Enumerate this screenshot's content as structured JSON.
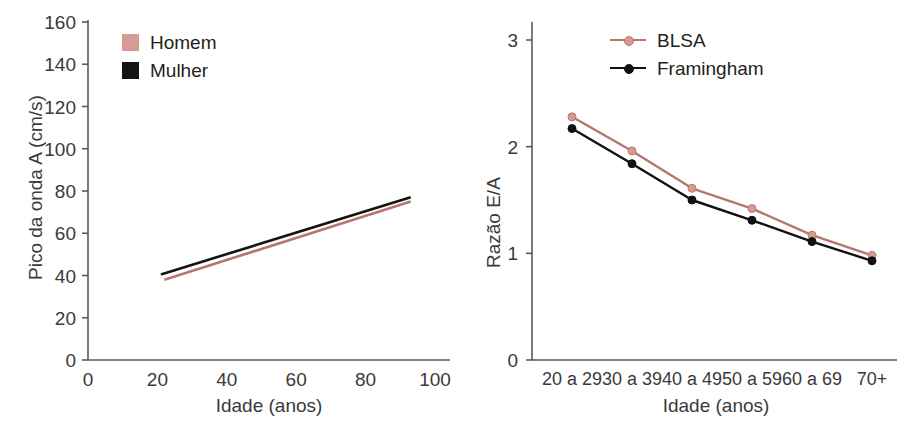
{
  "figure": {
    "background": "#ffffff",
    "panels": [
      "left",
      "right"
    ]
  },
  "colors": {
    "series_pink": "#b5766f",
    "series_pink_marker": "#d99a92",
    "series_black": "#111111",
    "axis": "#595959",
    "text": "#3a3a3a"
  },
  "left_panel": {
    "legend": [
      {
        "label": "Homem",
        "color": "#d59b94",
        "marker": "square"
      },
      {
        "label": "Mulher",
        "color": "#141414",
        "marker": "square"
      }
    ],
    "y_axis": {
      "title": "Pico da onda A (cm/s)",
      "ticks": [
        "0",
        "20",
        "40",
        "60",
        "80",
        "100",
        "120",
        "140",
        "160"
      ]
    },
    "x_axis": {
      "title": "Idade (anos)",
      "ticks": [
        "0",
        "20",
        "40",
        "60",
        "80",
        "100"
      ]
    }
  },
  "right_panel": {
    "legend": [
      {
        "label": "BLSA",
        "color": "#b5766f",
        "marker": "line-dot"
      },
      {
        "label": "Framingham",
        "color": "#111111",
        "marker": "line-dot"
      }
    ],
    "y_axis": {
      "title": "Razão E/A",
      "ticks": [
        "0",
        "1",
        "2",
        "3"
      ]
    },
    "x_axis": {
      "title": "Idade (anos)",
      "ticks": [
        "20 a 29",
        "30 a 39",
        "40 a 49",
        "50 a 59",
        "60 a 69",
        "70+"
      ]
    }
  },
  "chart_data": [
    {
      "type": "line",
      "id": "left-peak-a-wave-vs-age",
      "title": "",
      "xlabel": "Idade (anos)",
      "ylabel": "Pico da onda A (cm/s)",
      "xlim": [
        0,
        100
      ],
      "ylim": [
        0,
        160
      ],
      "xticks": [
        0,
        20,
        40,
        60,
        80,
        100
      ],
      "yticks": [
        0,
        20,
        40,
        60,
        80,
        100,
        120,
        140,
        160
      ],
      "grid": false,
      "legend_position": "top-left-inside",
      "note": "Two straight regression lines spanning roughly age 21 to age 93",
      "series": [
        {
          "name": "Homem",
          "color": "#b5766f",
          "x": [
            22,
            93
          ],
          "values": [
            38,
            75
          ]
        },
        {
          "name": "Mulher",
          "color": "#141414",
          "x": [
            21,
            93
          ],
          "values": [
            40.5,
            77
          ]
        }
      ]
    },
    {
      "type": "line",
      "id": "right-ea-ratio-vs-age-group",
      "title": "",
      "xlabel": "Idade (anos)",
      "ylabel": "Razão E/A",
      "xlim": [
        0,
        5
      ],
      "ylim": [
        0,
        3
      ],
      "yticks": [
        0,
        1,
        2,
        3
      ],
      "grid": false,
      "legend_position": "top-center-inside",
      "categories": [
        "20 a 29",
        "30 a 39",
        "40 a 49",
        "50 a 59",
        "60 a 69",
        "70+"
      ],
      "series": [
        {
          "name": "BLSA",
          "color": "#b5766f",
          "marker": "circle",
          "values": [
            2.28,
            1.96,
            1.61,
            1.42,
            1.17,
            0.98
          ]
        },
        {
          "name": "Framingham",
          "color": "#111111",
          "marker": "circle",
          "values": [
            2.17,
            1.84,
            1.5,
            1.31,
            1.11,
            0.93
          ]
        }
      ]
    }
  ]
}
